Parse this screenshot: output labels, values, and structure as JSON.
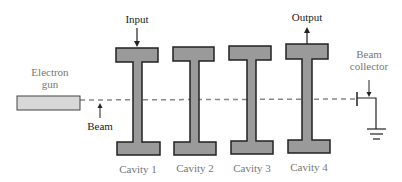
{
  "diagram": {
    "type": "klystron-amplifier",
    "labels": {
      "electron_gun_line1": "Electron",
      "electron_gun_line2": "gun",
      "beam": "Beam",
      "input": "Input",
      "output": "Output",
      "beam_collector_line1": "Beam",
      "beam_collector_line2": "collector"
    },
    "cavities": [
      {
        "label": "Cavity 1"
      },
      {
        "label": "Cavity 2"
      },
      {
        "label": "Cavity 3"
      },
      {
        "label": "Cavity 4"
      }
    ],
    "colors": {
      "cavity_fill": "#9a9a9a",
      "gun_fill": "#d8d8d8",
      "stroke": "#222222",
      "beam_dash": "#888888",
      "light_text": "#777777"
    }
  }
}
